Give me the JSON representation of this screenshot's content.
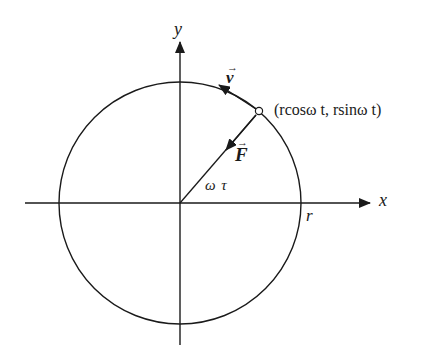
{
  "diagram": {
    "type": "circular-motion",
    "colors": {
      "stroke": "#1a1a1a",
      "background": "#ffffff"
    },
    "center": {
      "x": 180,
      "y": 203
    },
    "radius": 121,
    "point_angle_deg": 49.3,
    "axes": {
      "x": {
        "label": "x"
      },
      "y": {
        "label": "y"
      }
    },
    "labels": {
      "velocity": "v",
      "force": "F",
      "vector_arrow": "→",
      "angle": "ω τ",
      "radius": "r",
      "point": "(rcosω t, rsinω t)"
    }
  }
}
